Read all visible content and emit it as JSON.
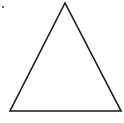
{
  "figure": {
    "width": 124,
    "height": 123,
    "background": "#ffffff",
    "stroke_color": "#1a1a1a",
    "stroke_width": 1.6,
    "shape": "triangle",
    "triangle": {
      "points": "65,3 10,111 121,111"
    },
    "marker_dot": {
      "cx": 3,
      "cy": 7,
      "r": 1,
      "color": "#333333"
    }
  }
}
